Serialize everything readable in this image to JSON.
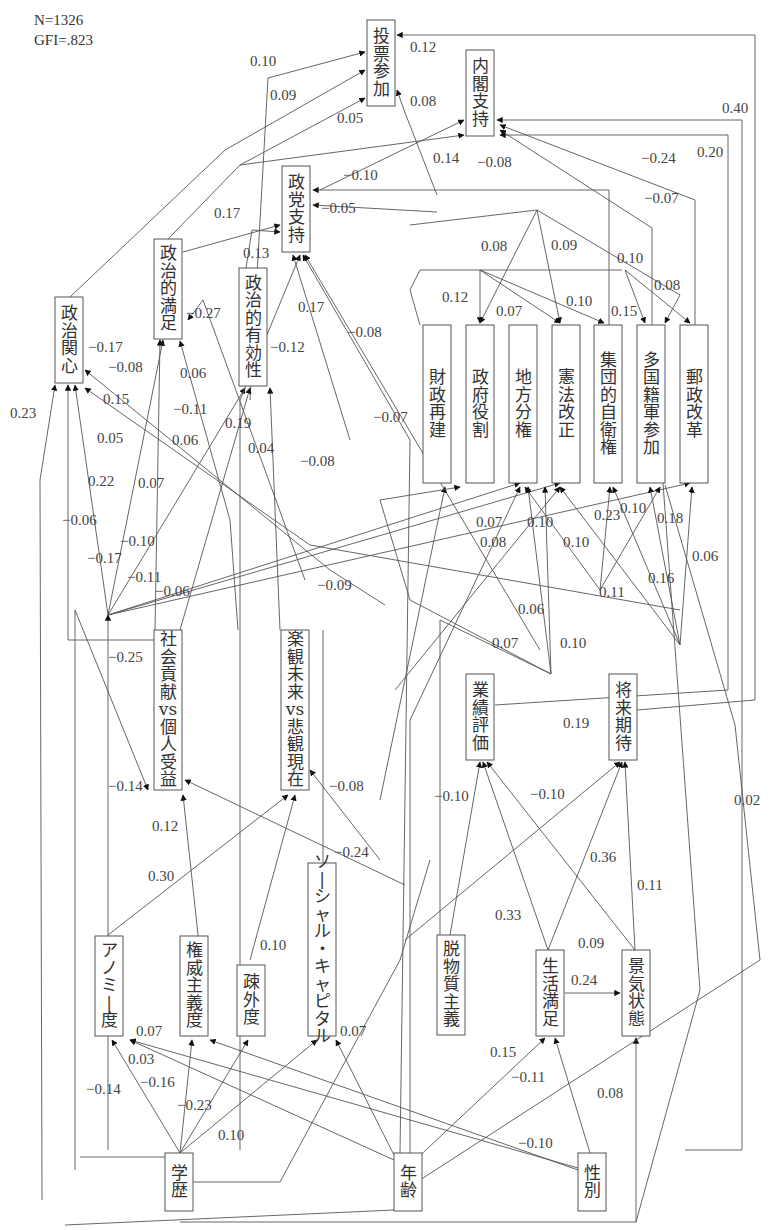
{
  "stats": {
    "n": "N=1326",
    "gfi": "GFI=.823"
  },
  "nodes": [
    {
      "id": "vote",
      "label": "投票参加",
      "x": 367,
      "y": 20,
      "w": 28,
      "h": 86
    },
    {
      "id": "cabinet",
      "label": "内閣支持",
      "x": 466,
      "y": 50,
      "w": 28,
      "h": 86
    },
    {
      "id": "party",
      "label": "政党支持",
      "x": 282,
      "y": 166,
      "w": 28,
      "h": 86
    },
    {
      "id": "pol_sat",
      "label": "政治的満足",
      "x": 154,
      "y": 239,
      "w": 28,
      "h": 100
    },
    {
      "id": "pol_eff",
      "label": "政治的有効性",
      "x": 239,
      "y": 268,
      "w": 28,
      "h": 118
    },
    {
      "id": "pol_int",
      "label": "政治関心",
      "x": 55,
      "y": 297,
      "w": 28,
      "h": 86
    },
    {
      "id": "fiscal",
      "label": "財政再建",
      "x": 423,
      "y": 325,
      "w": 28,
      "h": 158
    },
    {
      "id": "govrole",
      "label": "政府役割",
      "x": 466,
      "y": 325,
      "w": 28,
      "h": 158
    },
    {
      "id": "decent",
      "label": "地方分権",
      "x": 509,
      "y": 325,
      "w": 28,
      "h": 158
    },
    {
      "id": "const",
      "label": "憲法改正",
      "x": 552,
      "y": 325,
      "w": 28,
      "h": 158
    },
    {
      "id": "selfdef",
      "label": "集団的自衛権",
      "x": 594,
      "y": 325,
      "w": 28,
      "h": 158
    },
    {
      "id": "multi",
      "label": "多国籍軍参加",
      "x": 637,
      "y": 325,
      "w": 28,
      "h": 158
    },
    {
      "id": "postal",
      "label": "郵政改革",
      "x": 680,
      "y": 325,
      "w": 28,
      "h": 158
    },
    {
      "id": "social",
      "label": "社会貢献vs個人受益",
      "x": 154,
      "y": 630,
      "w": 28,
      "h": 160
    },
    {
      "id": "optim",
      "label": "楽観未来vs悲観現在",
      "x": 281,
      "y": 630,
      "w": 28,
      "h": 160
    },
    {
      "id": "perf",
      "label": "業績評価",
      "x": 466,
      "y": 674,
      "w": 28,
      "h": 86
    },
    {
      "id": "expect",
      "label": "将来期待",
      "x": 609,
      "y": 674,
      "w": 28,
      "h": 86
    },
    {
      "id": "socap",
      "label": "ソーシャル・キャピタル",
      "x": 308,
      "y": 863,
      "w": 28,
      "h": 173
    },
    {
      "id": "anomie",
      "label": "アノミー度",
      "x": 95,
      "y": 936,
      "w": 28,
      "h": 100
    },
    {
      "id": "author",
      "label": "権威主義度",
      "x": 180,
      "y": 936,
      "w": 28,
      "h": 100
    },
    {
      "id": "alien",
      "label": "疎外度",
      "x": 237,
      "y": 965,
      "w": 28,
      "h": 71
    },
    {
      "id": "postmat",
      "label": "脱物質主義",
      "x": 437,
      "y": 935,
      "w": 28,
      "h": 100
    },
    {
      "id": "lifesat",
      "label": "生活満足",
      "x": 536,
      "y": 950,
      "w": 28,
      "h": 86
    },
    {
      "id": "econ",
      "label": "景気状態",
      "x": 622,
      "y": 950,
      "w": 28,
      "h": 86
    },
    {
      "id": "edu",
      "label": "学歴",
      "x": 165,
      "y": 1153,
      "w": 28,
      "h": 58
    },
    {
      "id": "age",
      "label": "年齢",
      "x": 394,
      "y": 1153,
      "w": 28,
      "h": 58
    },
    {
      "id": "sex",
      "label": "性別",
      "x": 578,
      "y": 1153,
      "w": 28,
      "h": 58
    }
  ],
  "labels": [
    {
      "t": "0.10",
      "x": 250,
      "y": 66
    },
    {
      "t": "0.09",
      "x": 270,
      "y": 100
    },
    {
      "t": "0.05",
      "x": 337,
      "y": 123
    },
    {
      "t": "0.12",
      "x": 410,
      "y": 52
    },
    {
      "t": "0.08",
      "x": 410,
      "y": 106
    },
    {
      "t": "0.14",
      "x": 433,
      "y": 163
    },
    {
      "t": "−0.08",
      "x": 477,
      "y": 167
    },
    {
      "t": "0.40",
      "x": 722,
      "y": 113
    },
    {
      "t": "−0.24",
      "x": 641,
      "y": 163
    },
    {
      "t": "0.20",
      "x": 697,
      "y": 157
    },
    {
      "t": "−0.07",
      "x": 644,
      "y": 203
    },
    {
      "t": "−0.10",
      "x": 343,
      "y": 180
    },
    {
      "t": "−0.05",
      "x": 321,
      "y": 213
    },
    {
      "t": "0.17",
      "x": 214,
      "y": 218
    },
    {
      "t": "0.13",
      "x": 243,
      "y": 258
    },
    {
      "t": "0.08",
      "x": 481,
      "y": 251
    },
    {
      "t": "0.09",
      "x": 551,
      "y": 250
    },
    {
      "t": "0.10",
      "x": 617,
      "y": 263
    },
    {
      "t": "0.08",
      "x": 654,
      "y": 290
    },
    {
      "t": "0.12",
      "x": 442,
      "y": 302
    },
    {
      "t": "0.07",
      "x": 496,
      "y": 316
    },
    {
      "t": "0.10",
      "x": 566,
      "y": 306
    },
    {
      "t": "0.15",
      "x": 611,
      "y": 316
    },
    {
      "t": "−0.27",
      "x": 186,
      "y": 318
    },
    {
      "t": "−0.12",
      "x": 270,
      "y": 352
    },
    {
      "t": "0.17",
      "x": 298,
      "y": 312
    },
    {
      "t": "−0.08",
      "x": 347,
      "y": 337
    },
    {
      "t": "−0.07",
      "x": 373,
      "y": 422
    },
    {
      "t": "−0.17",
      "x": 88,
      "y": 352
    },
    {
      "t": "−0.08",
      "x": 108,
      "y": 372
    },
    {
      "t": "0.06",
      "x": 180,
      "y": 378
    },
    {
      "t": "0.15",
      "x": 103,
      "y": 404
    },
    {
      "t": "−0.11",
      "x": 173,
      "y": 414
    },
    {
      "t": "0.19",
      "x": 225,
      "y": 428
    },
    {
      "t": "0.23",
      "x": 10,
      "y": 418
    },
    {
      "t": "0.05",
      "x": 97,
      "y": 443
    },
    {
      "t": "0.06",
      "x": 172,
      "y": 445
    },
    {
      "t": "0.04",
      "x": 248,
      "y": 453
    },
    {
      "t": "−0.08",
      "x": 300,
      "y": 466
    },
    {
      "t": "0.22",
      "x": 88,
      "y": 486
    },
    {
      "t": "0.07",
      "x": 138,
      "y": 488
    },
    {
      "t": "−0.06",
      "x": 62,
      "y": 525
    },
    {
      "t": "−0.10",
      "x": 120,
      "y": 546
    },
    {
      "t": "−0.17",
      "x": 87,
      "y": 563
    },
    {
      "t": "−0.11",
      "x": 127,
      "y": 582
    },
    {
      "t": "−0.06",
      "x": 155,
      "y": 596
    },
    {
      "t": "−0.09",
      "x": 317,
      "y": 590
    },
    {
      "t": "0.07",
      "x": 476,
      "y": 527
    },
    {
      "t": "0.10",
      "x": 527,
      "y": 527
    },
    {
      "t": "0.08",
      "x": 480,
      "y": 547
    },
    {
      "t": "0.23",
      "x": 594,
      "y": 520
    },
    {
      "t": "0.10",
      "x": 620,
      "y": 513
    },
    {
      "t": "0.18",
      "x": 657,
      "y": 523
    },
    {
      "t": "0.10",
      "x": 563,
      "y": 547
    },
    {
      "t": "0.06",
      "x": 692,
      "y": 561
    },
    {
      "t": "0.11",
      "x": 599,
      "y": 597
    },
    {
      "t": "0.16",
      "x": 648,
      "y": 583
    },
    {
      "t": "0.06",
      "x": 518,
      "y": 614
    },
    {
      "t": "0.07",
      "x": 492,
      "y": 648
    },
    {
      "t": "0.10",
      "x": 560,
      "y": 648
    },
    {
      "t": "−0.25",
      "x": 108,
      "y": 662
    },
    {
      "t": "0.19",
      "x": 563,
      "y": 728
    },
    {
      "t": "−0.10",
      "x": 434,
      "y": 801
    },
    {
      "t": "−0.10",
      "x": 530,
      "y": 799
    },
    {
      "t": "0.02",
      "x": 734,
      "y": 805
    },
    {
      "t": "−0.14",
      "x": 108,
      "y": 791
    },
    {
      "t": "−0.08",
      "x": 329,
      "y": 791
    },
    {
      "t": "0.12",
      "x": 152,
      "y": 831
    },
    {
      "t": "−0.24",
      "x": 334,
      "y": 857
    },
    {
      "t": "0.30",
      "x": 148,
      "y": 881
    },
    {
      "t": "0.36",
      "x": 590,
      "y": 862
    },
    {
      "t": "0.11",
      "x": 637,
      "y": 890
    },
    {
      "t": "0.10",
      "x": 260,
      "y": 950
    },
    {
      "t": "0.33",
      "x": 495,
      "y": 920
    },
    {
      "t": "0.09",
      "x": 578,
      "y": 948
    },
    {
      "t": "0.24",
      "x": 571,
      "y": 985
    },
    {
      "t": "0.07",
      "x": 136,
      "y": 1036
    },
    {
      "t": "0.07",
      "x": 340,
      "y": 1036
    },
    {
      "t": "0.15",
      "x": 490,
      "y": 1057
    },
    {
      "t": "−0.11",
      "x": 511,
      "y": 1082
    },
    {
      "t": "0.08",
      "x": 597,
      "y": 1098
    },
    {
      "t": "0.03",
      "x": 128,
      "y": 1064
    },
    {
      "t": "−0.16",
      "x": 140,
      "y": 1087
    },
    {
      "t": "−0.14",
      "x": 86,
      "y": 1094
    },
    {
      "t": "−0.23",
      "x": 177,
      "y": 1110
    },
    {
      "t": "0.10",
      "x": 218,
      "y": 1140
    },
    {
      "t": "−0.10",
      "x": 518,
      "y": 1148
    }
  ]
}
